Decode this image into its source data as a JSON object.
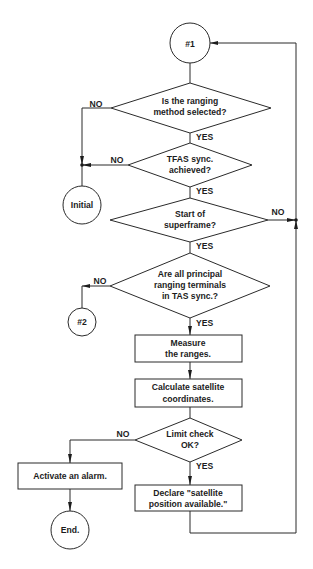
{
  "diagram": {
    "type": "flowchart",
    "connectors": {
      "start": "#1",
      "branch_out": "#2"
    },
    "terminals": {
      "initial": "Initial",
      "end": "End."
    },
    "decisions": [
      {
        "id": "d1",
        "lines": [
          "Is the ranging",
          "method selected?"
        ],
        "yes": "YES",
        "no": "NO"
      },
      {
        "id": "d2",
        "lines": [
          "TFAS sync.",
          "achieved?"
        ],
        "yes": "YES",
        "no": "NO"
      },
      {
        "id": "d3",
        "lines": [
          "Start of",
          "superframe?"
        ],
        "yes": "YES",
        "no": "NO"
      },
      {
        "id": "d4",
        "lines": [
          "Are all principal",
          "ranging terminals",
          "in TAS sync.?"
        ],
        "yes": "YES",
        "no": "NO"
      },
      {
        "id": "d5",
        "lines": [
          "Limit check",
          "OK?"
        ],
        "yes": "YES",
        "no": "NO"
      }
    ],
    "processes": [
      {
        "id": "p1",
        "lines": [
          "Measure",
          "the ranges."
        ]
      },
      {
        "id": "p2",
        "lines": [
          "Calculate satellite",
          "coordinates."
        ]
      },
      {
        "id": "p3",
        "lines": [
          "Activate an alarm."
        ]
      },
      {
        "id": "p4",
        "lines": [
          "Declare \"satellite",
          "position available.\""
        ]
      }
    ],
    "colors": {
      "line": "#2a2a2a",
      "text": "#1c1c1c",
      "background": "#ffffff"
    }
  }
}
